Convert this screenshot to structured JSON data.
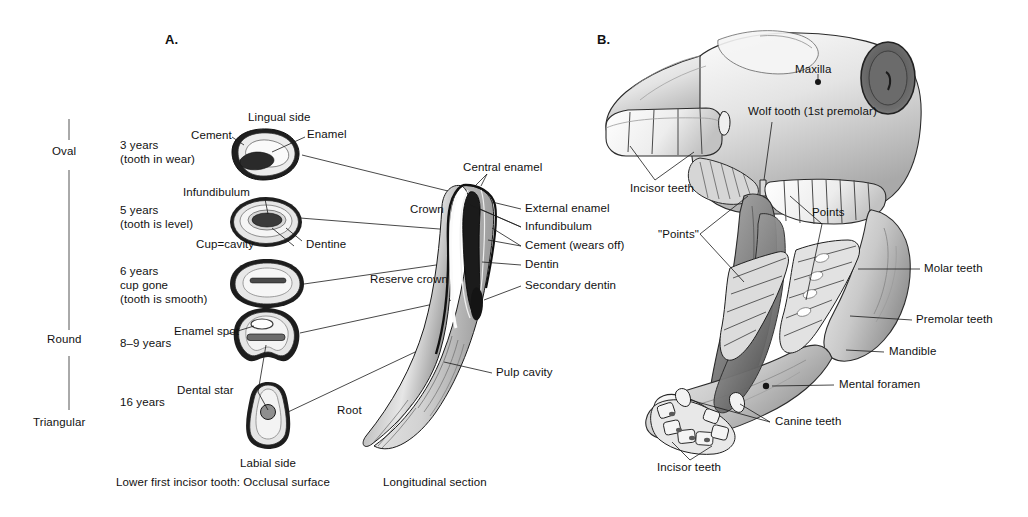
{
  "figure": {
    "background": "#ffffff",
    "text_color": "#111111"
  },
  "panel_a": {
    "letter": "A.",
    "caption": "Lower first incisor tooth: Occlusal surface",
    "top_label": "Lingual side",
    "bottom_label": "Labial side",
    "shape_axis": {
      "labels": [
        "Oval",
        "Round",
        "Triangular"
      ]
    },
    "age_rows": [
      {
        "age": "3 years",
        "note": "(tooth in wear)"
      },
      {
        "age": "5 years",
        "note": "(tooth is level)"
      },
      {
        "age": "6 years",
        "note": "cup gone",
        "note2": "(tooth is smooth)"
      },
      {
        "age": "8–9 years",
        "note": ""
      },
      {
        "age": "16 years",
        "note": ""
      }
    ],
    "section_labels": [
      "Cement",
      "Enamel",
      "Infundibulum",
      "Cup=cavity",
      "Dentine",
      "Enamel spot",
      "Dental star"
    ]
  },
  "panel_longitudinal": {
    "caption": "Longitudinal section",
    "labels_left": [
      "Crown",
      "Reserve crown",
      "Root"
    ],
    "labels_top": [
      "Central enamel"
    ],
    "labels_right": [
      "External enamel",
      "Infundibulum",
      "Cement (wears off)",
      "Dentin",
      "Secondary dentin",
      "Pulp cavity"
    ]
  },
  "panel_b": {
    "letter": "B.",
    "labels": [
      "Maxilla",
      "Wolf tooth (1st premolar)",
      "Incisor teeth",
      "Points",
      "\"Points\"",
      "Molar teeth",
      "Premolar teeth",
      "Mandible",
      "Mental foramen",
      "Canine teeth",
      "Incisor teeth"
    ]
  }
}
